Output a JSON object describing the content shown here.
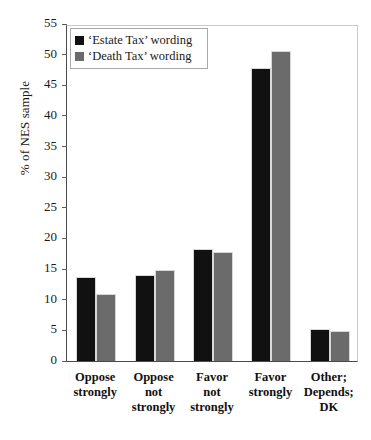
{
  "chart_data": {
    "type": "bar",
    "title": "",
    "subtitle": "",
    "xlabel": "",
    "ylabel": "% of NES sample",
    "ylim": [
      0,
      55
    ],
    "ytick_step": 5,
    "yticks": [
      0,
      5,
      10,
      15,
      20,
      25,
      30,
      35,
      40,
      45,
      50,
      55
    ],
    "ytick_labels": [
      "0",
      "5",
      "10",
      "15",
      "20",
      "25",
      "30",
      "35",
      "40",
      "45",
      "50",
      "55"
    ],
    "grid": false,
    "legend_position": "upper-left-inside",
    "categories": [
      "Oppose\nstrongly",
      "Oppose\nnot\nstrongly",
      "Favor\nnot\nstrongly",
      "Favor\nstrongly",
      "Other;\nDepends;\nDK"
    ],
    "category_lines": [
      [
        "Oppose",
        "strongly"
      ],
      [
        "Oppose",
        "not",
        "strongly"
      ],
      [
        "Favor",
        "not",
        "strongly"
      ],
      [
        "Favor",
        "strongly"
      ],
      [
        "Other;",
        "Depends;",
        "DK"
      ]
    ],
    "series": [
      {
        "name": "‘Estate Tax’ wording",
        "color": "#111111",
        "values": [
          13.7,
          14.0,
          18.2,
          47.9,
          5.2
        ]
      },
      {
        "name": "‘Death Tax’ wording",
        "color": "#6b6b6b",
        "values": [
          10.9,
          14.9,
          17.8,
          50.6,
          4.9
        ]
      }
    ],
    "legend": [
      "‘Estate Tax’ wording",
      "‘Death Tax’ wording"
    ]
  }
}
